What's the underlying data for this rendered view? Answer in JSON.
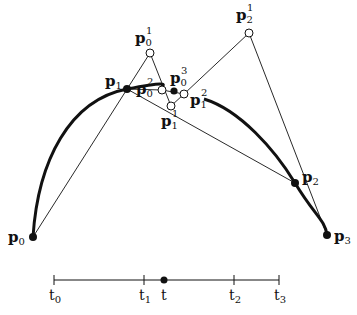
{
  "diagram": {
    "type": "de Casteljau / blossoming construction",
    "control_points": [
      {
        "id": "p0",
        "label": "p",
        "sub": "0",
        "sup": "",
        "x": 33,
        "y": 237,
        "style": "filled"
      },
      {
        "id": "p1",
        "label": "p",
        "sub": "1",
        "sup": "",
        "x": 127,
        "y": 89,
        "style": "filled"
      },
      {
        "id": "p2",
        "label": "p",
        "sub": "2",
        "sup": "",
        "x": 295,
        "y": 183,
        "style": "filled"
      },
      {
        "id": "p3",
        "label": "p",
        "sub": "3",
        "sup": "",
        "x": 327,
        "y": 235,
        "style": "filled"
      }
    ],
    "level1_points": [
      {
        "id": "p0_1",
        "label": "p",
        "sub": "0",
        "sup": "1",
        "x": 150,
        "y": 53,
        "style": "open"
      },
      {
        "id": "p1_1",
        "label": "p",
        "sub": "1",
        "sup": "1",
        "x": 171,
        "y": 106,
        "style": "open"
      },
      {
        "id": "p2_1",
        "label": "p",
        "sub": "2",
        "sup": "1",
        "x": 249,
        "y": 33,
        "style": "open"
      }
    ],
    "level2_points": [
      {
        "id": "p0_2",
        "label": "p",
        "sub": "0",
        "sup": "2",
        "x": 162,
        "y": 90,
        "style": "open"
      },
      {
        "id": "p1_2",
        "label": "p",
        "sub": "1",
        "sup": "2",
        "x": 184,
        "y": 94,
        "style": "open"
      }
    ],
    "level3_points": [
      {
        "id": "p0_3",
        "label": "p",
        "sub": "0",
        "sup": "3",
        "x": 174,
        "y": 91,
        "style": "filled"
      }
    ],
    "parameter_axis": {
      "y": 280,
      "x_start": 54,
      "x_end": 279,
      "ticks": [
        {
          "label": "t",
          "sub": "0",
          "x": 54
        },
        {
          "label": "t",
          "sub": "1",
          "x": 144
        },
        {
          "label": "t",
          "sub": "2",
          "x": 234
        },
        {
          "label": "t",
          "sub": "3",
          "x": 279
        }
      ],
      "marker": {
        "label": "t",
        "x": 164
      }
    },
    "colors": {
      "ink": "#111111",
      "background": "#ffffff"
    }
  }
}
